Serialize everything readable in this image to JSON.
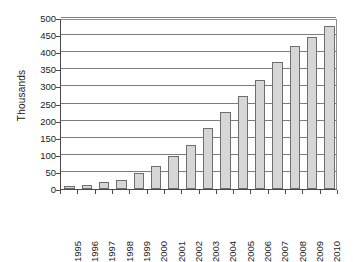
{
  "chart_data": {
    "type": "bar",
    "title": "",
    "subtitle": "",
    "xlabel": "",
    "ylabel": "Thousands",
    "categories": [
      "1995",
      "1996",
      "1997",
      "1998",
      "1999",
      "2000",
      "2001",
      "2002",
      "2003",
      "2004",
      "2005",
      "2006",
      "2007",
      "2008",
      "2009",
      "2010"
    ],
    "values": [
      8,
      13,
      20,
      27,
      46,
      67,
      96,
      128,
      177,
      225,
      273,
      320,
      370,
      417,
      444,
      476
    ],
    "ylim": [
      0,
      500
    ],
    "ytick_labels": [
      "0",
      "50",
      "100",
      "150",
      "200",
      "250",
      "300",
      "350",
      "400",
      "450",
      "500"
    ],
    "ytick_values": [
      0,
      50,
      100,
      150,
      200,
      250,
      300,
      350,
      400,
      450,
      500
    ],
    "grid": "horizontal",
    "legend": "none",
    "bar_color": "#d6d6d6",
    "bar_border_color": "#6e6e6e",
    "gridline_color": "#7d7d7d",
    "axis_color": "#4a4a4a",
    "text_color": "#1a1a1a",
    "background": "#ffffff"
  }
}
